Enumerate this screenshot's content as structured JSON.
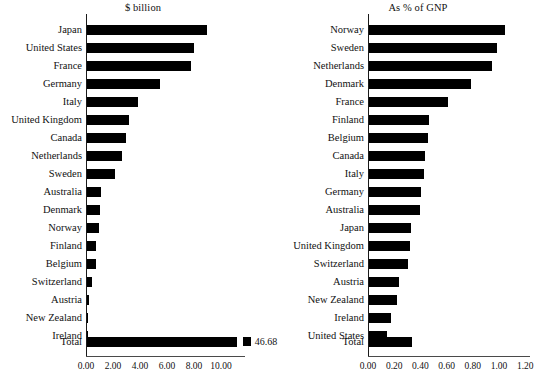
{
  "figure": {
    "width": 536,
    "height": 385,
    "background": "#ffffff",
    "bar_color": "#000000",
    "axis_color": "#1a1a1a"
  },
  "chart_data": [
    {
      "type": "bar",
      "orientation": "horizontal",
      "title": "$ billion",
      "xlabel": "",
      "ylabel": "",
      "xlim": [
        0,
        12
      ],
      "grid": false,
      "legend": "none",
      "tick_labels": [
        "0.00",
        "2.00",
        "4.00",
        "6.00",
        "8.00",
        "10.00"
      ],
      "tick_values": [
        0,
        2,
        4,
        6,
        8,
        10
      ],
      "categories": [
        "Japan",
        "United States",
        "France",
        "Germany",
        "Italy",
        "United Kingdom",
        "Canada",
        "Netherlands",
        "Sweden",
        "Australia",
        "Denmark",
        "Norway",
        "Finland",
        "Belgium",
        "Switzerland",
        "Austria",
        "New Zealand",
        "Ireland"
      ],
      "values": [
        8.9,
        7.9,
        7.7,
        5.4,
        3.8,
        3.1,
        2.9,
        2.6,
        2.1,
        1.0,
        0.95,
        0.9,
        0.7,
        0.65,
        0.4,
        0.15,
        0.05,
        0.04
      ],
      "total": {
        "label": "Total",
        "value": 11.1,
        "value_label": "46.68"
      }
    },
    {
      "type": "bar",
      "orientation": "horizontal",
      "title": "As % of GNP",
      "xlabel": "",
      "ylabel": "",
      "xlim": [
        0,
        1.2
      ],
      "grid": false,
      "legend": "none",
      "tick_labels": [
        "0.00",
        "0.20",
        "0.40",
        "0.60",
        "0.80",
        "1.00",
        "1.20"
      ],
      "tick_values": [
        0,
        0.2,
        0.4,
        0.6,
        0.8,
        1.0,
        1.2
      ],
      "categories": [
        "Norway",
        "Sweden",
        "Netherlands",
        "Denmark",
        "France",
        "Finland",
        "Belgium",
        "Canada",
        "Italy",
        "Germany",
        "Australia",
        "Japan",
        "United Kingdom",
        "Switzerland",
        "Austria",
        "New Zealand",
        "Ireland",
        "United States"
      ],
      "values": [
        1.04,
        0.98,
        0.94,
        0.78,
        0.6,
        0.46,
        0.45,
        0.43,
        0.42,
        0.4,
        0.39,
        0.32,
        0.31,
        0.3,
        0.23,
        0.21,
        0.17,
        0.14
      ],
      "total": {
        "label": "Total",
        "value": 0.33,
        "value_label": ""
      }
    }
  ]
}
